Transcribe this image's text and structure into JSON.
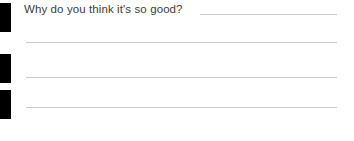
{
  "form": {
    "question": {
      "text": "Why do you think it's so good?"
    },
    "answer_lines": [
      {
        "id": "line-1",
        "value": ""
      },
      {
        "id": "line-2",
        "value": ""
      },
      {
        "id": "line-3",
        "value": ""
      },
      {
        "id": "line-4",
        "value": ""
      }
    ],
    "registration_marks": [
      {
        "id": "mark-1"
      },
      {
        "id": "mark-2"
      },
      {
        "id": "mark-3"
      }
    ],
    "colors": {
      "background": "#ffffff",
      "text": "#3c3c3c",
      "rule": "#c9cbcd",
      "mark": "#000000"
    }
  }
}
